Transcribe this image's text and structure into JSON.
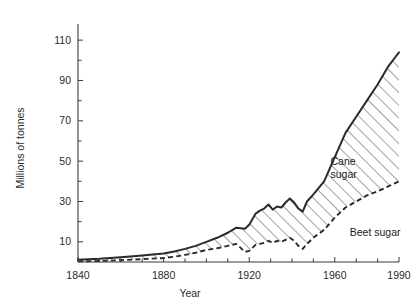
{
  "chart_data": {
    "type": "area",
    "title": "",
    "xlabel": "Year",
    "ylabel": "Millions of tonnes",
    "xlim": [
      1840,
      1990
    ],
    "ylim": [
      0,
      118
    ],
    "xticks": [
      1840,
      1850,
      1860,
      1870,
      1880,
      1890,
      1900,
      1910,
      1920,
      1930,
      1940,
      1950,
      1960,
      1970,
      1980,
      1990
    ],
    "xtick_labels": [
      "1840",
      "",
      "",
      "",
      "1880",
      "",
      "",
      "",
      "1920",
      "",
      "",
      "",
      "1960",
      "",
      "",
      "1990"
    ],
    "yticks": [
      10,
      20,
      30,
      40,
      50,
      60,
      70,
      80,
      90,
      100,
      110
    ],
    "ytick_labels": [
      "10",
      "",
      "30",
      "",
      "50",
      "",
      "70",
      "",
      "90",
      "",
      "110"
    ],
    "grid": false,
    "legend_position": "inline-annotations",
    "annotations": [
      {
        "text": "Cane sugar",
        "lines": [
          "Cane",
          "sugar"
        ],
        "x": 1958,
        "y": 48
      },
      {
        "text": "Beet sugar",
        "lines": [
          "Beet sugar"
        ],
        "x": 1967,
        "y": 13
      }
    ],
    "series": [
      {
        "name": "Total (cane + beet)",
        "style": "solid-line",
        "x": [
          1840,
          1850,
          1860,
          1870,
          1880,
          1885,
          1890,
          1895,
          1900,
          1905,
          1910,
          1914,
          1918,
          1920,
          1923,
          1925,
          1927,
          1929,
          1931,
          1933,
          1935,
          1937,
          1939,
          1941,
          1943,
          1945,
          1947,
          1950,
          1955,
          1960,
          1965,
          1970,
          1975,
          1980,
          1985,
          1990
        ],
        "values": [
          1.1,
          1.6,
          2.4,
          3.2,
          4.2,
          5.2,
          6.5,
          8.0,
          10.0,
          12.0,
          14.5,
          17.0,
          16.5,
          18.5,
          24.0,
          25.5,
          26.5,
          28.5,
          26.0,
          27.5,
          27.0,
          29.5,
          31.5,
          29.5,
          26.5,
          25.0,
          30.0,
          33.5,
          40.0,
          52.0,
          64.0,
          72.0,
          80.0,
          88.0,
          97.0,
          104.0
        ]
      },
      {
        "name": "Beet sugar",
        "style": "dashed-line",
        "x": [
          1840,
          1850,
          1860,
          1870,
          1880,
          1885,
          1890,
          1895,
          1900,
          1905,
          1910,
          1914,
          1918,
          1920,
          1923,
          1925,
          1927,
          1929,
          1931,
          1933,
          1935,
          1937,
          1939,
          1941,
          1943,
          1945,
          1947,
          1950,
          1955,
          1960,
          1965,
          1970,
          1975,
          1980,
          1985,
          1990
        ],
        "values": [
          0.3,
          0.5,
          0.9,
          1.4,
          2.0,
          2.6,
          3.5,
          4.6,
          6.0,
          6.8,
          8.0,
          9.0,
          5.0,
          5.5,
          8.5,
          9.0,
          9.5,
          10.5,
          9.5,
          10.5,
          10.0,
          11.0,
          12.0,
          10.5,
          8.0,
          6.5,
          9.0,
          12.0,
          16.0,
          22.0,
          27.0,
          30.0,
          33.0,
          35.0,
          37.5,
          40.0
        ]
      }
    ],
    "band": {
      "name": "Cane sugar",
      "description": "hatched region between total line and beet sugar line",
      "fill": "diagonal-hatch"
    }
  },
  "axes": {
    "y_axis_title": "Millions of tonnes",
    "x_axis_title": "Year"
  },
  "colors": {
    "line": "#2a2a2a",
    "axis": "#3b3b3b",
    "background": "#ffffff",
    "hatch": "#555555"
  }
}
